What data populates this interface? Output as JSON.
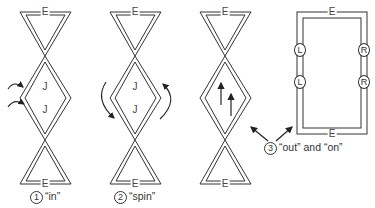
{
  "figures": [
    {
      "id": "in",
      "number": "1",
      "caption": "“in”",
      "top_label": "E",
      "bottom_label": "E",
      "diamond_labels": [
        "J",
        "J"
      ],
      "arrows": "two curved arrows pointing into diamond from left"
    },
    {
      "id": "spin",
      "number": "2",
      "caption": "“spin”",
      "top_label": "E",
      "bottom_label": "E",
      "diamond_labels": [
        "J",
        "J"
      ],
      "arrows": "two curved arrows circling diamond (rotation)"
    },
    {
      "id": "out",
      "top_label": "E",
      "bottom_label": "E",
      "diamond_labels": [],
      "arrows": "two upward straight arrows inside diamond"
    },
    {
      "id": "on",
      "top_label": "E",
      "bottom_label": "E",
      "left_labels": [
        "L",
        "L"
      ],
      "right_labels": [
        "R",
        "R"
      ]
    }
  ],
  "shared_caption": {
    "number": "3",
    "text": "“out” and “on”"
  }
}
